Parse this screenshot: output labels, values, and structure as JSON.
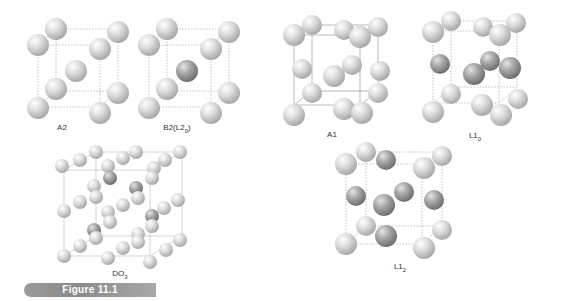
{
  "figure": {
    "caption_label": "Figure 11.1",
    "colors": {
      "sphere_light": "#d6d6d6",
      "sphere_dark": "#9c9c9c",
      "edge_line": "#999999",
      "label_bar": "#999999"
    }
  },
  "structures": [
    {
      "id": "A2",
      "label": "A2",
      "label_main": "A2",
      "label_sub": "",
      "type": "bcc",
      "center_shade": "light"
    },
    {
      "id": "B2",
      "label": "B2(L2₀)",
      "label_main": "B2(L2",
      "label_sub": "0",
      "label_tail": ")",
      "type": "bcc",
      "center_shade": "dark"
    },
    {
      "id": "A1",
      "label": "A1",
      "label_main": "A1",
      "label_sub": "",
      "type": "fcc",
      "face_shade": "light"
    },
    {
      "id": "L10",
      "label": "L1₀",
      "label_main": "L1",
      "label_sub": "0",
      "type": "fcc",
      "face_shade": "mixed"
    },
    {
      "id": "DO3",
      "label": "DO₃",
      "label_main": "DO",
      "label_sub": "3",
      "type": "superlattice",
      "face_shade": "mixed"
    },
    {
      "id": "L12",
      "label": "L1₂",
      "label_main": "L1",
      "label_sub": "2",
      "type": "fcc",
      "face_shade": "dark"
    }
  ]
}
